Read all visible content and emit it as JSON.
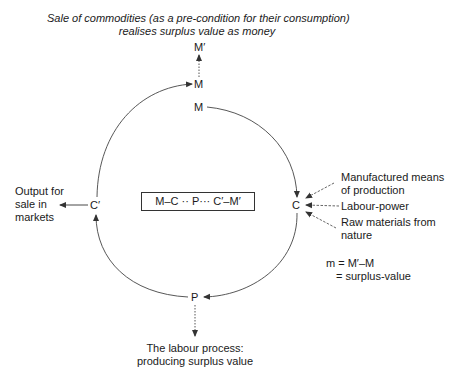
{
  "title": {
    "line1": "Sale of commodities (as a pre-condition for their consumption)",
    "line2": "realises surplus value as money"
  },
  "nodes": {
    "m_prime": "M′",
    "m_top": "M",
    "m_start": "M",
    "c": "C",
    "p": "P",
    "c_prime": "C′"
  },
  "formula_box": "M–C ·· P··· C′–M′",
  "inputs": {
    "means": [
      "Manufactured means",
      "of production"
    ],
    "labour": "Labour-power",
    "raw": [
      "Raw materials from",
      "nature"
    ]
  },
  "output": [
    "Output for",
    "sale in",
    "markets"
  ],
  "labour_process": [
    "The labour process:",
    "producing surplus value"
  ],
  "surplus": {
    "line1": "m = M′–M",
    "line2": "= surplus-value"
  },
  "colors": {
    "line": "#333333",
    "text": "#1a1a1a"
  }
}
